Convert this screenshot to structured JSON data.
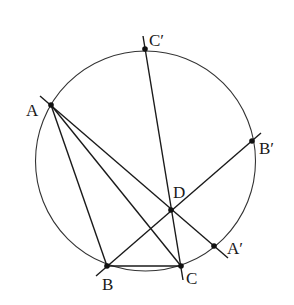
{
  "diagram": {
    "type": "geometry",
    "circle": {
      "cx": 145.5,
      "cy": 161,
      "r": 110
    },
    "points": {
      "A": {
        "x": 51,
        "y": 105,
        "label": "A",
        "lx": 26,
        "ly": 116
      },
      "B": {
        "x": 107,
        "y": 266,
        "label": "B",
        "lx": 104,
        "ly": 290
      },
      "C": {
        "x": 181,
        "y": 266,
        "label": "C",
        "lx": 186,
        "ly": 284
      },
      "D": {
        "x": 171,
        "y": 210,
        "label": "D",
        "lx": 174,
        "ly": 198
      },
      "A_prime": {
        "x": 214,
        "y": 246,
        "label": "A′",
        "lx": 228,
        "ly": 253
      },
      "B_prime": {
        "x": 252,
        "y": 141,
        "label": "B′",
        "lx": 259,
        "ly": 153
      },
      "C_prime": {
        "x": 145,
        "y": 49,
        "label": "C′",
        "lx": 149,
        "ly": 45
      }
    },
    "segments": [
      {
        "name": "AB",
        "from": [
          51,
          105
        ],
        "to": [
          107,
          266
        ]
      },
      {
        "name": "AC",
        "from": [
          51,
          105
        ],
        "to": [
          181,
          266
        ]
      },
      {
        "name": "BC",
        "from": [
          107,
          266
        ],
        "to": [
          181,
          266
        ]
      },
      {
        "name": "AA-prime-line",
        "from": [
          40,
          96
        ],
        "to": [
          228,
          258
        ]
      },
      {
        "name": "BB-prime-line",
        "from": [
          96,
          276
        ],
        "to": [
          261,
          133
        ]
      },
      {
        "name": "CC-prime-line",
        "from": [
          143,
          36
        ],
        "to": [
          183,
          280
        ]
      }
    ]
  }
}
